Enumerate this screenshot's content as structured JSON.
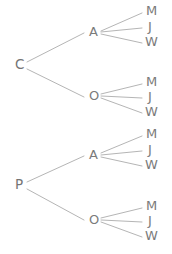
{
  "diagram": {
    "type": "tree",
    "background_color": "#ffffff",
    "line_color": "#b5b5b5",
    "text_color": "#7b7b7b",
    "width": 172,
    "height": 254,
    "levels": 3,
    "nodes": [
      {
        "id": "root-c",
        "label": "C",
        "level": 1,
        "x": 15,
        "y": 65,
        "class": "node-root"
      },
      {
        "id": "root-p",
        "label": "P",
        "level": 1,
        "x": 15,
        "y": 185,
        "class": "node-root"
      },
      {
        "id": "c-a",
        "label": "A",
        "level": 2,
        "x": 89,
        "y": 32,
        "class": "node-mid"
      },
      {
        "id": "c-o",
        "label": "O",
        "level": 2,
        "x": 89,
        "y": 96,
        "class": "node-mid"
      },
      {
        "id": "p-a",
        "label": "A",
        "level": 2,
        "x": 89,
        "y": 155,
        "class": "node-mid"
      },
      {
        "id": "p-o",
        "label": "O",
        "level": 2,
        "x": 89,
        "y": 220,
        "class": "node-mid"
      },
      {
        "id": "c-a-m",
        "label": "M",
        "level": 3,
        "x": 146,
        "y": 11,
        "class": "node-leaf"
      },
      {
        "id": "c-a-j",
        "label": "J",
        "level": 3,
        "x": 148,
        "y": 27,
        "class": "node-leaf"
      },
      {
        "id": "c-a-w",
        "label": "W",
        "level": 3,
        "x": 145,
        "y": 42,
        "class": "node-leaf"
      },
      {
        "id": "c-o-m",
        "label": "M",
        "level": 3,
        "x": 146,
        "y": 82,
        "class": "node-leaf"
      },
      {
        "id": "c-o-j",
        "label": "J",
        "level": 3,
        "x": 148,
        "y": 97,
        "class": "node-leaf"
      },
      {
        "id": "c-o-w",
        "label": "W",
        "level": 3,
        "x": 145,
        "y": 112,
        "class": "node-leaf"
      },
      {
        "id": "p-a-m",
        "label": "M",
        "level": 3,
        "x": 146,
        "y": 134,
        "class": "node-leaf"
      },
      {
        "id": "p-a-j",
        "label": "J",
        "level": 3,
        "x": 148,
        "y": 150,
        "class": "node-leaf"
      },
      {
        "id": "p-a-w",
        "label": "W",
        "level": 3,
        "x": 145,
        "y": 165,
        "class": "node-leaf"
      },
      {
        "id": "p-o-m",
        "label": "M",
        "level": 3,
        "x": 146,
        "y": 206,
        "class": "node-leaf"
      },
      {
        "id": "p-o-j",
        "label": "J",
        "level": 3,
        "x": 148,
        "y": 221,
        "class": "node-leaf"
      },
      {
        "id": "p-o-w",
        "label": "W",
        "level": 3,
        "x": 145,
        "y": 236,
        "class": "node-leaf"
      }
    ],
    "edges": [
      {
        "id": "e-c-a",
        "from": "C",
        "to": "A",
        "x1": 27,
        "y1": 62,
        "x2": 84,
        "y2": 33
      },
      {
        "id": "e-c-o",
        "from": "C",
        "to": "O",
        "x1": 27,
        "y1": 69,
        "x2": 84,
        "y2": 97
      },
      {
        "id": "e-p-a",
        "from": "P",
        "to": "A",
        "x1": 27,
        "y1": 182,
        "x2": 84,
        "y2": 156
      },
      {
        "id": "e-p-o",
        "from": "P",
        "to": "O",
        "x1": 27,
        "y1": 189,
        "x2": 84,
        "y2": 220
      },
      {
        "id": "e-ca-m",
        "from": "A",
        "to": "M",
        "x1": 101,
        "y1": 31,
        "x2": 142,
        "y2": 13
      },
      {
        "id": "e-ca-j",
        "from": "A",
        "to": "J",
        "x1": 101,
        "y1": 32,
        "x2": 142,
        "y2": 28
      },
      {
        "id": "e-ca-w",
        "from": "A",
        "to": "W",
        "x1": 101,
        "y1": 34,
        "x2": 142,
        "y2": 43
      },
      {
        "id": "e-co-m",
        "from": "O",
        "to": "M",
        "x1": 101,
        "y1": 94,
        "x2": 142,
        "y2": 84
      },
      {
        "id": "e-co-j",
        "from": "O",
        "to": "J",
        "x1": 101,
        "y1": 96,
        "x2": 142,
        "y2": 98
      },
      {
        "id": "e-co-w",
        "from": "O",
        "to": "W",
        "x1": 101,
        "y1": 98,
        "x2": 142,
        "y2": 113
      },
      {
        "id": "e-pa-m",
        "from": "A",
        "to": "M",
        "x1": 101,
        "y1": 153,
        "x2": 142,
        "y2": 136
      },
      {
        "id": "e-pa-j",
        "from": "A",
        "to": "J",
        "x1": 101,
        "y1": 155,
        "x2": 142,
        "y2": 151
      },
      {
        "id": "e-pa-w",
        "from": "A",
        "to": "W",
        "x1": 101,
        "y1": 157,
        "x2": 142,
        "y2": 166
      },
      {
        "id": "e-po-m",
        "from": "O",
        "to": "M",
        "x1": 101,
        "y1": 218,
        "x2": 142,
        "y2": 208
      },
      {
        "id": "e-po-j",
        "from": "O",
        "to": "J",
        "x1": 101,
        "y1": 220,
        "x2": 142,
        "y2": 222
      },
      {
        "id": "e-po-w",
        "from": "O",
        "to": "W",
        "x1": 101,
        "y1": 222,
        "x2": 142,
        "y2": 237
      }
    ]
  }
}
